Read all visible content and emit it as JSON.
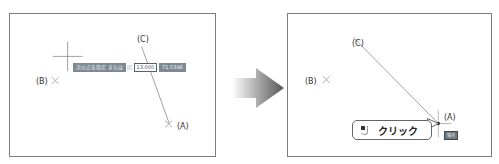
{
  "left_panel": {
    "labels": {
      "c": "(C)",
      "b": "(B)",
      "a": "(A)"
    },
    "tooltip": {
      "prompt": "次の点を指定 または",
      "input_value": "13.000",
      "angle_value": "71.5348"
    }
  },
  "right_panel": {
    "labels": {
      "c": "(C)",
      "b": "(B)",
      "a": "(A)"
    },
    "snap_badge": "端点",
    "callout": {
      "text": "クリック"
    }
  },
  "colors": {
    "frame": "#7d7d7d",
    "tooltip_bg": "#7e8a8f",
    "line": "#777777"
  }
}
